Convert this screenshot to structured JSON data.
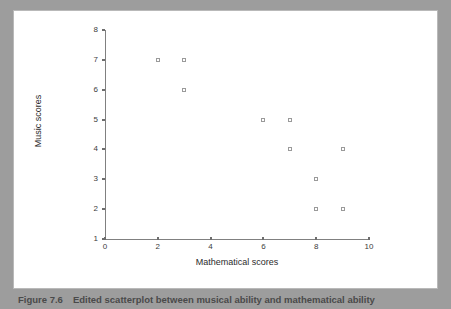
{
  "figure": {
    "caption_label": "Figure 7.6",
    "caption_text": "Edited scatterplot between musical ability and mathematical ability"
  },
  "colors": {
    "page_background": "#9d9d9d",
    "panel_background": "#ffffff",
    "axis": "#808080",
    "marker_outline": "#9a9a9a",
    "text": "#2b2b2b"
  },
  "chart_data": {
    "type": "scatter",
    "title": "",
    "xlabel": "Mathematical scores",
    "ylabel": "Music scores",
    "xlim": [
      0,
      10
    ],
    "ylim": [
      1,
      8
    ],
    "xticks": [
      0,
      2,
      4,
      6,
      8,
      10
    ],
    "yticks": [
      1,
      2,
      3,
      4,
      5,
      6,
      7,
      8
    ],
    "xtick_labels": [
      "0",
      "2",
      "4",
      "6",
      "8",
      "10"
    ],
    "ytick_labels": [
      "1",
      "2",
      "3",
      "4",
      "5",
      "6",
      "7",
      "8"
    ],
    "grid": false,
    "legend": null,
    "marker": "open-square",
    "points": [
      {
        "x": 2,
        "y": 7
      },
      {
        "x": 3,
        "y": 7
      },
      {
        "x": 3,
        "y": 6
      },
      {
        "x": 6,
        "y": 5
      },
      {
        "x": 7,
        "y": 5
      },
      {
        "x": 7,
        "y": 4
      },
      {
        "x": 9,
        "y": 4
      },
      {
        "x": 8,
        "y": 3
      },
      {
        "x": 8,
        "y": 2
      },
      {
        "x": 9,
        "y": 2
      }
    ]
  }
}
